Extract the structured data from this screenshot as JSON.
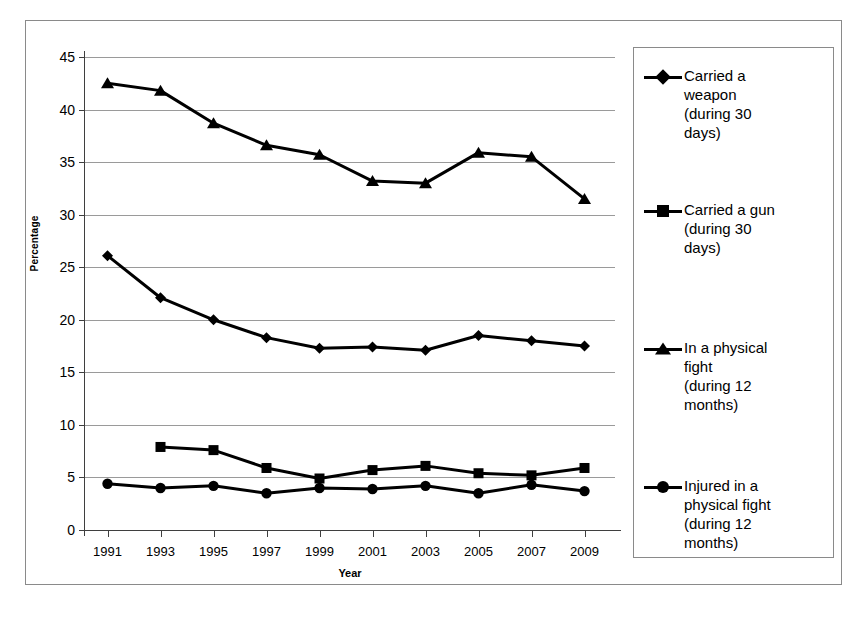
{
  "chart_data": {
    "type": "line",
    "title": "",
    "xlabel": "Year",
    "ylabel": "Percentage",
    "categories": [
      "1991",
      "1993",
      "1995",
      "1997",
      "1999",
      "2001",
      "2003",
      "2005",
      "2007",
      "2009"
    ],
    "ylim": [
      0,
      45
    ],
    "yticks": [
      "0",
      "5",
      "10",
      "15",
      "20",
      "25",
      "30",
      "35",
      "40",
      "45"
    ],
    "grid": true,
    "legend_position": "right",
    "series": [
      {
        "name": "Carried a weapon (during 30 days)",
        "legend_label": "Carried a weapon (during 30 days)",
        "marker": "diamond",
        "color": "#000000",
        "values": [
          26.1,
          22.1,
          20.0,
          18.3,
          17.3,
          17.4,
          17.1,
          18.5,
          18.0,
          17.5
        ]
      },
      {
        "name": "Carried a gun (during 30 days)",
        "legend_label": "Carried a gun (during 30 days)",
        "marker": "square",
        "color": "#000000",
        "values": [
          null,
          7.9,
          7.6,
          5.9,
          4.9,
          5.7,
          6.1,
          5.4,
          5.2,
          5.9
        ]
      },
      {
        "name": "In a physical fight (during 12 months)",
        "legend_label": "In a physical fight (during 12 months)",
        "marker": "triangle",
        "color": "#000000",
        "values": [
          42.5,
          41.8,
          38.7,
          36.6,
          35.7,
          33.2,
          33.0,
          35.9,
          35.5,
          31.5
        ]
      },
      {
        "name": "Injured in a physical fight (during 12 months)",
        "legend_label": "Injured in a physical fight (during 12 months)",
        "marker": "circle",
        "color": "#000000",
        "values": [
          4.4,
          4.0,
          4.2,
          3.5,
          4.0,
          3.9,
          4.2,
          3.5,
          4.3,
          3.7
        ]
      }
    ]
  },
  "axes": {
    "y_label": "Percentage",
    "x_label": "Year",
    "y_tick_labels": [
      "45",
      "40",
      "35",
      "30",
      "25",
      "20",
      "15",
      "10",
      "5",
      "0"
    ],
    "x_tick_labels": [
      "1991",
      "1993",
      "1995",
      "1997",
      "1999",
      "2001",
      "2003",
      "2005",
      "2007",
      "2009"
    ]
  },
  "legend": {
    "items": [
      {
        "label": "Carried a weapon (during 30 days)",
        "marker": "diamond"
      },
      {
        "label": "Carried a gun (during 30 days)",
        "marker": "square"
      },
      {
        "label": "In a physical fight (during 12 months)",
        "marker": "triangle"
      },
      {
        "label": "Injured in a physical fight (during 12 months)",
        "marker": "circle"
      }
    ],
    "lines": [
      [
        "Carried a",
        "weapon",
        "(during 30",
        "days)"
      ],
      [
        "Carried a gun",
        "(during 30",
        "days)"
      ],
      [
        "In a physical",
        "fight",
        "(during 12",
        "months)"
      ],
      [
        "Injured in a",
        "physical fight",
        "(during 12",
        "months)"
      ]
    ]
  },
  "colors": {
    "series": "#000000",
    "grid": "#9a9a9a",
    "axis": "#3f3f3f",
    "frame": "#8a8a8a",
    "background": "#ffffff"
  }
}
